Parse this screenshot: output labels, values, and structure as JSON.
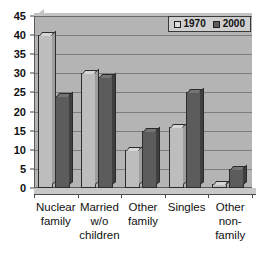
{
  "chart_data": {
    "type": "bar",
    "title": "",
    "subtitle": "",
    "xlabel": "",
    "ylabel": "",
    "ylim": [
      0,
      45
    ],
    "ytick_step": 5,
    "yticks": [
      0,
      5,
      10,
      15,
      20,
      25,
      30,
      35,
      40,
      45
    ],
    "grid": true,
    "grid_axis": "y",
    "legend_position": "top-right",
    "style": "3d-bar",
    "categories": [
      "Nuclear family",
      "Married w/o children",
      "Other family",
      "Singles",
      "Other non-family"
    ],
    "category_label_lines": [
      [
        "Nuclear",
        "family"
      ],
      [
        "Married",
        "w/o",
        "children"
      ],
      [
        "Other",
        "family"
      ],
      [
        "Singles"
      ],
      [
        "Other",
        "non-",
        "family"
      ]
    ],
    "series": [
      {
        "name": "1970",
        "color": "#bdbdbd",
        "values": [
          40,
          30,
          10,
          16,
          1
        ]
      },
      {
        "name": "2000",
        "color": "#5c5c5c",
        "values": [
          24,
          29,
          15,
          25,
          5
        ]
      }
    ]
  },
  "legend": {
    "items": [
      {
        "label": "1970",
        "swatch": "legend-swatch-1970"
      },
      {
        "label": "2000",
        "swatch": "legend-swatch-2000"
      }
    ]
  },
  "colors": {
    "plot_background": "#b4b4b4",
    "gridline": "#7d7d7d",
    "axis": "#4a4a4a",
    "series_1970": "#bdbdbd",
    "series_2000": "#5c5c5c",
    "text": "#111111",
    "page_background": "#ffffff"
  }
}
